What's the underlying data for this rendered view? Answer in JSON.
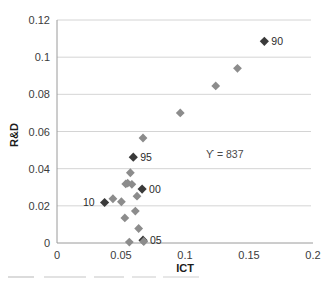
{
  "chart_data": {
    "type": "scatter",
    "title": "",
    "xlabel": "ICT",
    "ylabel": "R&D",
    "xlim": [
      0,
      0.2
    ],
    "ylim": [
      0,
      0.12
    ],
    "xticks": [
      "0",
      "0.05",
      "0.1",
      "0.15",
      "0.2"
    ],
    "xtick_values": [
      0,
      0.05,
      0.1,
      0.15,
      0.2
    ],
    "yticks": [
      "0",
      "0.02",
      "0.04",
      "0.06",
      "0.08",
      "0.1",
      "0.12"
    ],
    "ytick_values": [
      0,
      0.02,
      0.04,
      0.06,
      0.08,
      0.1,
      0.12
    ],
    "grid": "horizontal",
    "legend": "none",
    "marker": "diamond",
    "colors": {
      "marker_default": "#8c8c8c",
      "marker_highlight": "#3a3a3a",
      "gridline": "#c9c9c9",
      "axis": "#9a9a9a",
      "text": "#3b3b3b"
    },
    "annotations": [
      {
        "text": "ϒ = 837",
        "x": 0.131,
        "y": 0.0455
      }
    ],
    "points": [
      {
        "x": 0.162,
        "y": 0.1085,
        "label": "90",
        "highlight": true,
        "label_dx": 7,
        "label_dy": 4
      },
      {
        "x": 0.141,
        "y": 0.094,
        "label": "",
        "highlight": false,
        "label_dx": 0,
        "label_dy": 0
      },
      {
        "x": 0.124,
        "y": 0.0845,
        "label": "",
        "highlight": false,
        "label_dx": 0,
        "label_dy": 0
      },
      {
        "x": 0.0963,
        "y": 0.07,
        "label": "",
        "highlight": false,
        "label_dx": 0,
        "label_dy": 0
      },
      {
        "x": 0.0672,
        "y": 0.0565,
        "label": "",
        "highlight": false,
        "label_dx": 0,
        "label_dy": 0
      },
      {
        "x": 0.0596,
        "y": 0.0462,
        "label": "95",
        "highlight": true,
        "label_dx": 7,
        "label_dy": 4
      },
      {
        "x": 0.0573,
        "y": 0.0378,
        "label": "",
        "highlight": false,
        "label_dx": 0,
        "label_dy": 0
      },
      {
        "x": 0.0552,
        "y": 0.0322,
        "label": "",
        "highlight": false,
        "label_dx": 0,
        "label_dy": 0
      },
      {
        "x": 0.0537,
        "y": 0.0318,
        "label": "",
        "highlight": false,
        "label_dx": 0,
        "label_dy": 0
      },
      {
        "x": 0.0585,
        "y": 0.0316,
        "label": "",
        "highlight": false,
        "label_dx": 0,
        "label_dy": 0
      },
      {
        "x": 0.0665,
        "y": 0.029,
        "label": "00",
        "highlight": true,
        "label_dx": 7,
        "label_dy": 4
      },
      {
        "x": 0.0625,
        "y": 0.0252,
        "label": "",
        "highlight": false,
        "label_dx": 0,
        "label_dy": 0
      },
      {
        "x": 0.0437,
        "y": 0.0238,
        "label": "",
        "highlight": false,
        "label_dx": 0,
        "label_dy": 0
      },
      {
        "x": 0.0503,
        "y": 0.0222,
        "label": "",
        "highlight": false,
        "label_dx": 0,
        "label_dy": 0
      },
      {
        "x": 0.0372,
        "y": 0.0218,
        "label": "10",
        "highlight": true,
        "label_dx": -10,
        "label_dy": 4,
        "label_anchor": "end"
      },
      {
        "x": 0.0612,
        "y": 0.0172,
        "label": "",
        "highlight": false,
        "label_dx": 0,
        "label_dy": 0
      },
      {
        "x": 0.053,
        "y": 0.0135,
        "label": "",
        "highlight": false,
        "label_dx": 0,
        "label_dy": 0
      },
      {
        "x": 0.0638,
        "y": 0.0078,
        "label": "",
        "highlight": false,
        "label_dx": 0,
        "label_dy": 0
      },
      {
        "x": 0.0565,
        "y": 0.0005,
        "label": "",
        "highlight": false,
        "label_dx": 0,
        "label_dy": 0
      },
      {
        "x": 0.0672,
        "y": 0.0015,
        "label": "05",
        "highlight": true,
        "label_dx": 7,
        "label_dy": 4
      },
      {
        "x": 0.0678,
        "y": 0.0008,
        "label": "",
        "highlight": false,
        "label_dx": 0,
        "label_dy": 0
      }
    ]
  }
}
